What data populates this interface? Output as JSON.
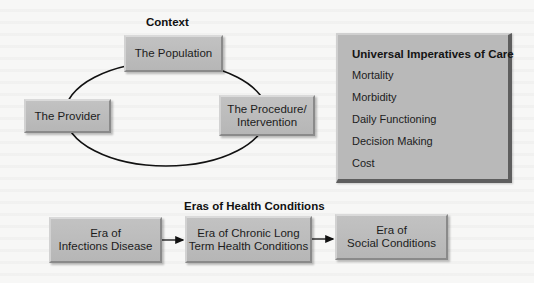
{
  "context": {
    "heading": "Context",
    "nodes": {
      "population": "The Population",
      "provider": "The Provider",
      "procedure_line1": "The Procedure/",
      "procedure_line2": "Intervention"
    }
  },
  "imperatives": {
    "title": "Universal Imperatives of Care",
    "items": [
      "Mortality",
      "Morbidity",
      "Daily Functioning",
      "Decision Making",
      "Cost"
    ]
  },
  "eras": {
    "heading": "Eras of Health Conditions",
    "boxes": [
      {
        "line1": "Era of",
        "line2": "Infections Disease"
      },
      {
        "line1": "Era of Chronic Long",
        "line2": "Term Health Conditions"
      },
      {
        "line1": "Era of",
        "line2": "Social Conditions"
      }
    ],
    "connector": "arrow-right"
  },
  "colors": {
    "box_fill": "#b9b9b9",
    "box_shadow_edge": "#5e5e5e",
    "line": "#111111",
    "background": "#f7f7f6"
  }
}
